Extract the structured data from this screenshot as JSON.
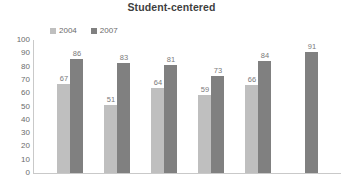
{
  "chart_data": {
    "type": "bar",
    "title": "Student-centered",
    "xlabel": "",
    "ylabel": "",
    "ylim": [
      0,
      100
    ],
    "ytick_step": 10,
    "yticks": [
      100,
      90,
      80,
      70,
      60,
      50,
      40,
      30,
      20,
      10,
      0
    ],
    "grid": false,
    "legend_position": "top-left",
    "categories": [
      "1",
      "2",
      "3",
      "4",
      "5",
      "6"
    ],
    "series": [
      {
        "name": "2004",
        "color": "#bfbfbf",
        "values": [
          67,
          51,
          64,
          59,
          66,
          null
        ],
        "labels": [
          "67",
          "51",
          "64",
          "59",
          "66",
          ""
        ]
      },
      {
        "name": "2007",
        "color": "#808080",
        "values": [
          86,
          83,
          81,
          73,
          84,
          91
        ],
        "labels": [
          "86",
          "83",
          "81",
          "73",
          "84",
          "91"
        ]
      }
    ]
  },
  "legend": {
    "items": [
      {
        "label": "2004",
        "color": "#bfbfbf"
      },
      {
        "label": "2007",
        "color": "#808080"
      }
    ]
  },
  "axis": {
    "y_tick_labels": [
      "100",
      "90",
      "80",
      "70",
      "60",
      "50",
      "40",
      "30",
      "20",
      "10",
      "0"
    ]
  }
}
